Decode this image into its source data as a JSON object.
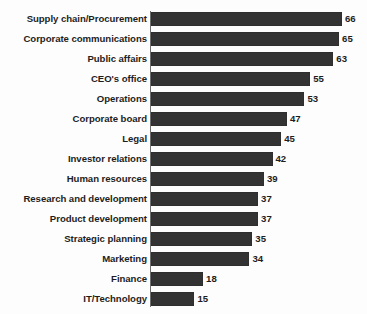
{
  "chart_data": {
    "type": "bar",
    "orientation": "horizontal",
    "title": "",
    "subtitle": "",
    "xlabel": "",
    "ylabel": "",
    "xlim": [
      0,
      70
    ],
    "grid": false,
    "legend": null,
    "data_labels": true,
    "bar_color": "#333333",
    "axis_color": "#6f6f6f",
    "background_color": "#fdfdfd",
    "categories": [
      "Supply chain/Procurement",
      "Corporate communications",
      "Public affairs",
      "CEO's office",
      "Operations",
      "Corporate board",
      "Legal",
      "Investor relations",
      "Human resources",
      "Research and development",
      "Product development",
      "Strategic planning",
      "Marketing",
      "Finance",
      "IT/Technology"
    ],
    "values": [
      66,
      65,
      63,
      55,
      53,
      47,
      45,
      42,
      39,
      37,
      37,
      35,
      34,
      18,
      15
    ],
    "value_labels": [
      "66",
      "65",
      "63",
      "55",
      "53",
      "47",
      "45",
      "42",
      "39",
      "37",
      "37",
      "35",
      "34",
      "18",
      "15"
    ],
    "rows": [
      {
        "label": "Supply chain/Procurement",
        "value": 66,
        "value_label": "66"
      },
      {
        "label": "Corporate communications",
        "value": 65,
        "value_label": "65"
      },
      {
        "label": "Public affairs",
        "value": 63,
        "value_label": "63"
      },
      {
        "label": "CEO's office",
        "value": 55,
        "value_label": "55"
      },
      {
        "label": "Operations",
        "value": 53,
        "value_label": "53"
      },
      {
        "label": "Corporate board",
        "value": 47,
        "value_label": "47"
      },
      {
        "label": "Legal",
        "value": 45,
        "value_label": "45"
      },
      {
        "label": "Investor relations",
        "value": 42,
        "value_label": "42"
      },
      {
        "label": "Human resources",
        "value": 39,
        "value_label": "39"
      },
      {
        "label": "Research and development",
        "value": 37,
        "value_label": "37"
      },
      {
        "label": "Product development",
        "value": 37,
        "value_label": "37"
      },
      {
        "label": "Strategic planning",
        "value": 35,
        "value_label": "35"
      },
      {
        "label": "Marketing",
        "value": 34,
        "value_label": "34"
      },
      {
        "label": "Finance",
        "value": 18,
        "value_label": "18"
      },
      {
        "label": "IT/Technology",
        "value": 15,
        "value_label": "15"
      }
    ]
  }
}
